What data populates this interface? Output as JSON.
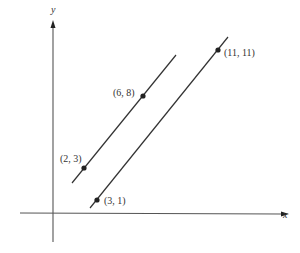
{
  "diagram": {
    "type": "coordinate-plane",
    "axes": {
      "x_label": "x",
      "y_label": "y",
      "color": "#555555"
    },
    "line_color": "#333333",
    "point_color": "#222222",
    "lines": [
      {
        "name": "upper-line",
        "points": [
          {
            "label": "(2, 3)",
            "x": 2,
            "y": 3
          },
          {
            "label": "(6, 8)",
            "x": 6,
            "y": 8
          }
        ]
      },
      {
        "name": "lower-line",
        "points": [
          {
            "label": "(3, 1)",
            "x": 3,
            "y": 1
          },
          {
            "label": "(11, 11)",
            "x": 11,
            "y": 11
          }
        ]
      }
    ]
  }
}
